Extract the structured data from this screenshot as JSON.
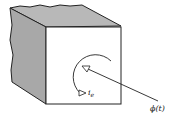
{
  "diagram": {
    "current_label": "i",
    "current_subscript": "e",
    "flux_label": "ϕ(t)",
    "colors": {
      "shaded_face": "#b8b8b8",
      "front_face": "#ffffff",
      "stroke": "#222222"
    }
  }
}
